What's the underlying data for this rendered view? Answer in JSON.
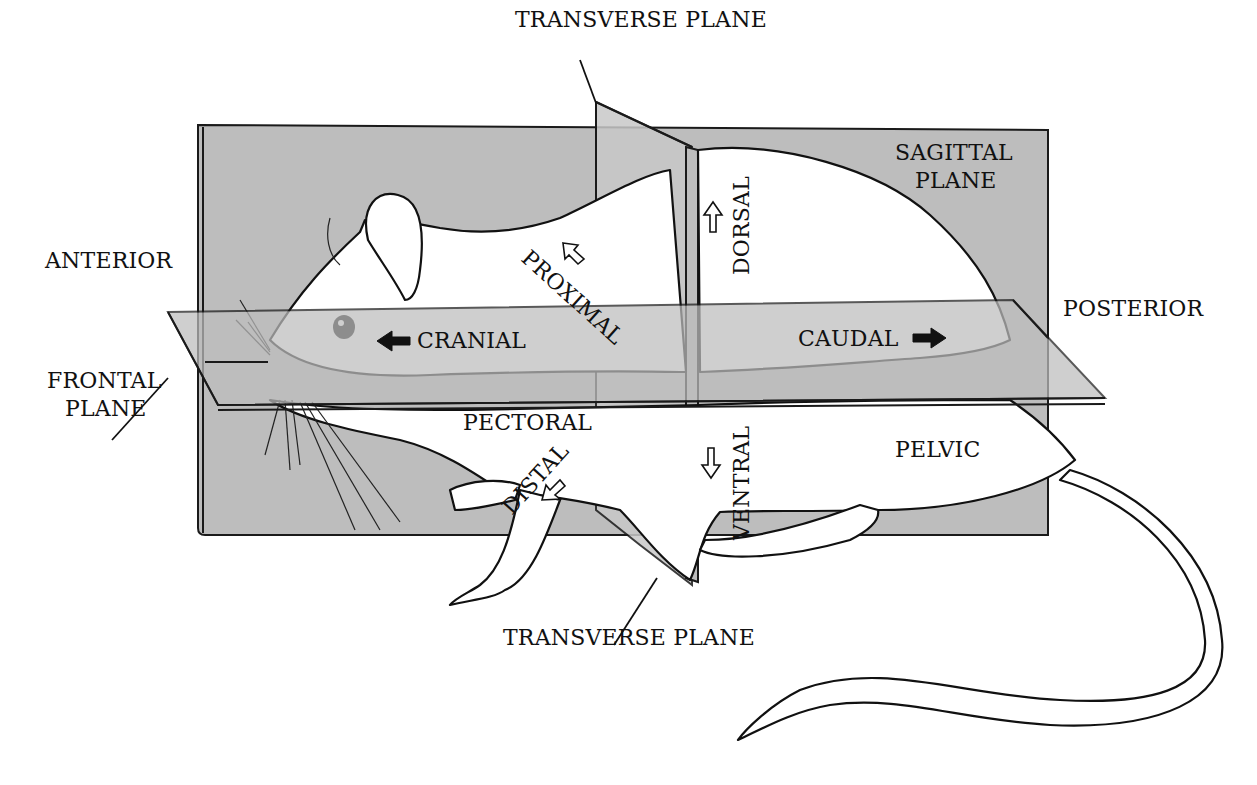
{
  "diagram": {
    "colors": {
      "plane_fill": "#bdbdbd",
      "outline": "#111111",
      "background": "#ffffff"
    },
    "labels": {
      "transverse_plane_top": "TRANSVERSE PLANE",
      "sagittal_plane_line1": "SAGITTAL",
      "sagittal_plane_line2": "PLANE",
      "anterior": "ANTERIOR",
      "posterior": "POSTERIOR",
      "frontal_plane_line1": "FRONTAL",
      "frontal_plane_line2": "PLANE",
      "cranial": "CRANIAL",
      "caudal": "CAUDAL",
      "proximal": "PROXIMAL",
      "distal": "DISTAL",
      "dorsal": "DORSAL",
      "ventral": "VENTRAL",
      "pectoral": "PECTORAL",
      "pelvic": "PELVIC",
      "transverse_plane_bottom": "TRANSVERSE PLANE"
    },
    "arrows": [
      {
        "name": "cranial-arrow",
        "style": "solid",
        "direction": "left"
      },
      {
        "name": "caudal-arrow",
        "style": "solid",
        "direction": "right"
      },
      {
        "name": "proximal-arrow",
        "style": "hollow",
        "direction": "up-left"
      },
      {
        "name": "distal-arrow",
        "style": "hollow",
        "direction": "down-left"
      },
      {
        "name": "dorsal-arrow",
        "style": "hollow",
        "direction": "up"
      },
      {
        "name": "ventral-arrow",
        "style": "hollow",
        "direction": "down"
      }
    ]
  }
}
